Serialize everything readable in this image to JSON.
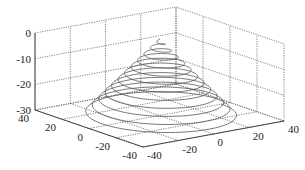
{
  "chart_data": {
    "type": "line3d",
    "title": "",
    "xlabel": "",
    "ylabel": "",
    "zlabel": "",
    "xlim": [
      -40,
      40
    ],
    "ylim": [
      -40,
      40
    ],
    "zlim": [
      -30,
      0
    ],
    "x_ticks": [
      "-40",
      "-20",
      "0",
      "20",
      "40"
    ],
    "y_ticks": [
      "40",
      "20",
      "0",
      "-20",
      "-40"
    ],
    "z_ticks": [
      "0",
      "-10",
      "-20",
      "-30"
    ],
    "grid": true,
    "series": [
      {
        "name": "spiral",
        "param": "x=r cos t, y=r sin t, z=-r*30/35",
        "turns": 12,
        "r_max": 35,
        "color": "#555555"
      }
    ]
  },
  "labels": {
    "z": [
      "0",
      "-10",
      "-20",
      "-30"
    ],
    "y": [
      "40",
      "20",
      "0",
      "-20",
      "-40"
    ],
    "x": [
      "-40",
      "-20",
      "0",
      "20",
      "40"
    ]
  }
}
